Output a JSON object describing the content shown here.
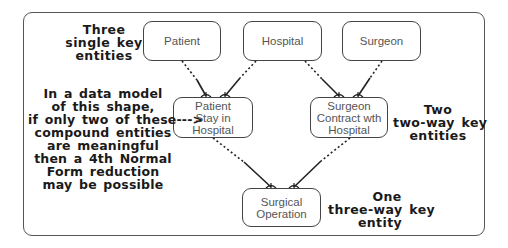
{
  "diagram": {
    "entities": {
      "patient": {
        "label": "Patient"
      },
      "hospital": {
        "label": "Hospital"
      },
      "surgeon": {
        "label": "Surgeon"
      },
      "patient_stay": {
        "lines": [
          "Patient",
          "Stay in",
          "Hospital"
        ]
      },
      "surgeon_contract": {
        "lines": [
          "Surgeon",
          "Contract wth",
          "Hospital"
        ]
      },
      "surgical_operation": {
        "lines": [
          "Surgical",
          "Operation"
        ]
      }
    },
    "notes": {
      "single_key": [
        "Three",
        "single key",
        "entities"
      ],
      "two_way": [
        "Two",
        "two-way key",
        "entities"
      ],
      "three_way": [
        "One",
        "three-way key",
        "entity"
      ],
      "fourth_nf": [
        "In a data model",
        "of this shape,",
        "if only two of these--->",
        "compound entities",
        "are meaningful",
        "then a 4th Normal",
        "Form reduction",
        "may be possible"
      ]
    },
    "relationships": [
      {
        "from": "Patient",
        "to": "Patient Stay in Hospital",
        "type": "one-to-many optional"
      },
      {
        "from": "Hospital",
        "to": "Patient Stay in Hospital",
        "type": "one-to-many optional"
      },
      {
        "from": "Hospital",
        "to": "Surgeon Contract wth Hospital",
        "type": "one-to-many optional"
      },
      {
        "from": "Surgeon",
        "to": "Surgeon Contract wth Hospital",
        "type": "one-to-many optional"
      },
      {
        "from": "Patient Stay in Hospital",
        "to": "Surgical Operation",
        "type": "one-to-many optional"
      },
      {
        "from": "Surgeon Contract wth Hospital",
        "to": "Surgical Operation",
        "type": "one-to-many optional"
      }
    ],
    "colors": {
      "line": "#222222",
      "box_border": "#444444",
      "entity_text": "#555555",
      "note_text": "#1a1a1a"
    }
  }
}
